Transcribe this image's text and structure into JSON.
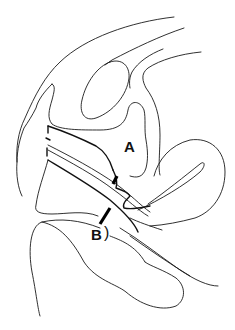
{
  "diagram": {
    "type": "anatomical-line-drawing",
    "view": "sagittal section",
    "labels": [
      {
        "id": "A",
        "text": "A"
      },
      {
        "id": "B",
        "text": "B"
      }
    ],
    "markers": [
      {
        "label": "A",
        "kind": "thick-bar"
      },
      {
        "label": "B",
        "kind": "thick-bar"
      }
    ],
    "annotation_b_suffix": ")"
  }
}
